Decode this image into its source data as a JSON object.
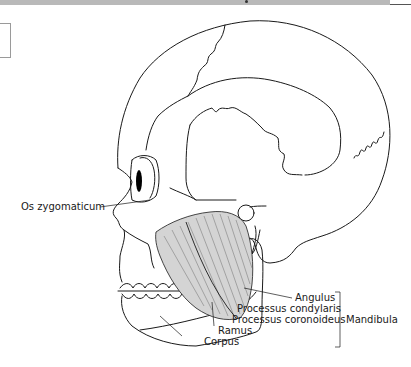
{
  "figure": {
    "labels": {
      "os_zygomaticum": "Os zygomaticum",
      "angulus": "Angulus",
      "processus_condylaris": "Processus condylaris",
      "processus_coronoideus": "Processus coronoideus",
      "ramus": "Ramus",
      "corpus": "Corpus",
      "mandibula": "Mandibula"
    }
  },
  "colors": {
    "line": "#1a1a1a",
    "header_bar": "#b9b9b9",
    "muscle_fill": "#c8c8c8",
    "background": "#ffffff"
  }
}
